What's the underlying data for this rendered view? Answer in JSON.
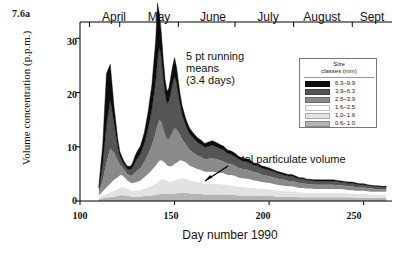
{
  "figure_label": "7.6a",
  "axes": {
    "ylabel": "Volume concentration (p.p.m.)",
    "xlabel": "Day number 1990",
    "yticks": [
      "0",
      "10",
      "20",
      "30"
    ],
    "xticks": [
      "100",
      "150",
      "200",
      "250"
    ]
  },
  "months": [
    {
      "label": "April",
      "center_day": 105
    },
    {
      "label": "May",
      "center_day": 135
    },
    {
      "label": "June",
      "center_day": 166
    },
    {
      "label": "July",
      "center_day": 196
    },
    {
      "label": "August",
      "center_day": 227
    },
    {
      "label": "Sept",
      "center_day": 255
    }
  ],
  "annotations": {
    "running_means": "5 pt running\nmeans\n(3.4 days)",
    "total_volume": "Total particulate volume"
  },
  "legend": {
    "title": "Size\nclasses (mm)",
    "title_line1": "Size",
    "title_line2": "classes (mm)",
    "entries": [
      {
        "label": "6.3–9.9",
        "color": "#0d0d0d"
      },
      {
        "label": "3.9–6.3",
        "color": "#555555"
      },
      {
        "label": "2.5–3.9",
        "color": "#8a8a8a"
      },
      {
        "label": "1.6–2.5",
        "color": "#ffffff"
      },
      {
        "label": "1.0–1.6",
        "color": "#e2e2e2"
      },
      {
        "label": "0.6–1.0",
        "color": "#b5b5b5"
      }
    ]
  },
  "chart_data": {
    "type": "area",
    "stacked": true,
    "title": "",
    "xlabel": "Day number 1990",
    "ylabel": "Volume concentration (p.p.m.)",
    "xlim": [
      100,
      265
    ],
    "ylim": [
      0,
      33
    ],
    "grid": false,
    "legend_position": "top-right",
    "x": [
      110,
      112,
      114,
      116,
      118,
      120,
      121,
      122,
      123,
      124,
      125,
      126,
      127,
      128,
      129,
      130,
      132,
      134,
      136,
      138,
      140,
      141,
      142,
      143,
      144,
      145,
      146,
      147,
      148,
      149,
      150,
      151,
      152,
      153,
      154,
      155,
      156,
      157,
      158,
      160,
      162,
      164,
      166,
      168,
      170,
      172,
      174,
      176,
      178,
      180,
      182,
      184,
      186,
      188,
      190,
      192,
      194,
      196,
      198,
      200,
      202,
      204,
      206,
      208,
      210,
      212,
      214,
      216,
      218,
      220,
      222,
      224,
      226,
      228,
      230,
      232,
      234,
      236,
      238,
      240,
      242,
      244,
      246,
      248,
      250,
      252,
      254,
      256,
      258,
      260,
      262
    ],
    "series": [
      {
        "name": "0.6-1.0",
        "color": "#b5b5b5",
        "values": [
          0.3,
          0.5,
          0.6,
          0.7,
          0.8,
          0.9,
          1.0,
          1.1,
          1.0,
          1.0,
          0.9,
          0.9,
          0.8,
          0.8,
          0.8,
          0.8,
          0.8,
          0.9,
          0.9,
          1.0,
          1.1,
          1.2,
          1.3,
          1.4,
          1.4,
          1.4,
          1.3,
          1.3,
          1.3,
          1.3,
          1.4,
          1.4,
          1.5,
          1.5,
          1.5,
          1.5,
          1.5,
          1.5,
          1.4,
          1.4,
          1.3,
          1.3,
          1.2,
          1.2,
          1.2,
          1.2,
          1.2,
          1.2,
          1.1,
          1.1,
          1.1,
          1.0,
          1.0,
          1.0,
          1.0,
          1.0,
          0.9,
          0.9,
          0.9,
          0.9,
          0.9,
          0.8,
          0.8,
          0.8,
          0.8,
          0.8,
          0.8,
          0.7,
          0.7,
          0.7,
          0.7,
          0.7,
          0.7,
          0.7,
          0.7,
          0.7,
          0.7,
          0.7,
          0.7,
          0.7,
          0.7,
          0.7,
          0.6,
          0.6,
          0.6,
          0.6,
          0.6,
          0.6,
          0.6,
          0.6,
          0.6
        ]
      },
      {
        "name": "1.0-1.6",
        "color": "#e2e2e2",
        "values": [
          0.3,
          0.5,
          0.7,
          0.9,
          1.1,
          1.3,
          1.4,
          1.5,
          1.5,
          1.4,
          1.3,
          1.2,
          1.1,
          1.1,
          1.1,
          1.1,
          1.2,
          1.4,
          1.6,
          1.8,
          2.1,
          2.3,
          2.5,
          2.6,
          2.6,
          2.5,
          2.4,
          2.3,
          2.3,
          2.3,
          2.4,
          2.5,
          2.6,
          2.7,
          2.7,
          2.7,
          2.6,
          2.5,
          2.4,
          2.3,
          2.2,
          2.1,
          2.0,
          2.0,
          2.0,
          2.0,
          1.9,
          1.9,
          1.8,
          1.8,
          1.7,
          1.6,
          1.6,
          1.5,
          1.5,
          1.4,
          1.4,
          1.3,
          1.3,
          1.2,
          1.2,
          1.1,
          1.1,
          1.0,
          1.0,
          1.0,
          0.9,
          0.9,
          0.9,
          0.8,
          0.8,
          0.8,
          0.8,
          0.8,
          0.8,
          0.8,
          0.8,
          0.8,
          0.8,
          0.8,
          0.7,
          0.7,
          0.7,
          0.7,
          0.7,
          0.7,
          0.6,
          0.6,
          0.6,
          0.6,
          0.6
        ]
      },
      {
        "name": "1.6-2.5",
        "color": "#ffffff",
        "values": [
          0.4,
          0.8,
          1.2,
          1.6,
          2.0,
          2.2,
          2.3,
          2.2,
          2.0,
          1.8,
          1.6,
          1.5,
          1.4,
          1.4,
          1.5,
          1.6,
          1.8,
          2.1,
          2.5,
          2.9,
          3.3,
          3.5,
          3.6,
          3.5,
          3.3,
          3.1,
          2.9,
          2.8,
          2.8,
          2.9,
          3.0,
          3.1,
          3.2,
          3.3,
          3.2,
          3.1,
          3.0,
          2.8,
          2.7,
          2.5,
          2.4,
          2.3,
          2.2,
          2.2,
          2.2,
          2.1,
          2.1,
          2.0,
          1.9,
          1.9,
          1.8,
          1.7,
          1.6,
          1.6,
          1.5,
          1.4,
          1.4,
          1.3,
          1.2,
          1.2,
          1.1,
          1.1,
          1.0,
          1.0,
          0.9,
          0.9,
          0.9,
          0.8,
          0.8,
          0.8,
          0.8,
          0.7,
          0.7,
          0.7,
          0.7,
          0.7,
          0.7,
          0.7,
          0.7,
          0.6,
          0.6,
          0.6,
          0.6,
          0.6,
          0.6,
          0.5,
          0.5,
          0.5,
          0.5,
          0.5,
          0.5
        ]
      },
      {
        "name": "2.5-3.9",
        "color": "#8a8a8a",
        "values": [
          0.6,
          2.0,
          4.5,
          6.5,
          5.0,
          3.0,
          2.0,
          1.6,
          1.4,
          1.3,
          1.2,
          1.2,
          1.3,
          1.5,
          1.8,
          2.0,
          2.3,
          2.8,
          3.6,
          4.6,
          6.0,
          7.0,
          7.6,
          7.0,
          6.0,
          5.2,
          4.8,
          5.0,
          5.6,
          6.2,
          6.6,
          6.2,
          5.4,
          4.6,
          4.0,
          3.6,
          3.3,
          3.1,
          2.9,
          2.7,
          2.5,
          2.4,
          2.3,
          2.4,
          2.5,
          2.4,
          2.3,
          2.2,
          2.1,
          2.0,
          1.9,
          1.8,
          1.7,
          1.7,
          1.6,
          1.5,
          1.5,
          1.4,
          1.3,
          1.3,
          1.2,
          1.2,
          1.1,
          1.1,
          1.0,
          1.0,
          0.9,
          0.9,
          0.9,
          0.8,
          0.8,
          0.8,
          0.8,
          0.8,
          0.8,
          0.8,
          0.8,
          0.7,
          0.7,
          0.7,
          0.7,
          0.7,
          0.6,
          0.6,
          0.6,
          0.6,
          0.6,
          0.5,
          0.5,
          0.5,
          0.5
        ]
      },
      {
        "name": "3.9-6.3",
        "color": "#555555",
        "values": [
          0.8,
          3.0,
          7.0,
          9.0,
          5.5,
          2.6,
          1.6,
          1.2,
          1.0,
          0.9,
          0.9,
          1.0,
          1.2,
          1.5,
          1.9,
          2.2,
          2.6,
          3.4,
          4.8,
          6.6,
          9.5,
          12.0,
          13.5,
          12.0,
          9.5,
          7.6,
          6.6,
          7.0,
          8.0,
          9.0,
          9.6,
          8.6,
          7.0,
          5.6,
          4.6,
          4.0,
          3.5,
          3.2,
          3.0,
          2.7,
          2.5,
          2.3,
          2.2,
          2.3,
          2.4,
          2.3,
          2.2,
          2.1,
          1.9,
          1.8,
          1.7,
          1.6,
          1.5,
          1.5,
          1.4,
          1.3,
          1.3,
          1.2,
          1.2,
          1.1,
          1.1,
          1.0,
          1.0,
          0.9,
          0.9,
          0.9,
          0.8,
          0.8,
          0.8,
          0.7,
          0.7,
          0.7,
          0.7,
          0.7,
          0.7,
          0.7,
          0.7,
          0.7,
          0.6,
          0.6,
          0.6,
          0.6,
          0.6,
          0.5,
          0.5,
          0.5,
          0.5,
          0.5,
          0.5,
          0.4,
          0.4
        ]
      },
      {
        "name": "6.3-9.9",
        "color": "#0d0d0d",
        "values": [
          0.6,
          3.5,
          9.5,
          6.5,
          3.0,
          1.4,
          0.9,
          0.7,
          0.6,
          0.5,
          0.5,
          0.6,
          0.7,
          0.9,
          1.1,
          1.3,
          1.5,
          2.0,
          3.0,
          4.5,
          7.5,
          10.5,
          6.0,
          4.5,
          3.5,
          2.6,
          2.2,
          2.4,
          2.8,
          3.2,
          3.4,
          3.0,
          2.4,
          1.9,
          1.6,
          1.4,
          1.2,
          1.1,
          1.0,
          0.9,
          0.8,
          0.8,
          0.7,
          0.8,
          0.8,
          0.8,
          0.7,
          0.7,
          0.6,
          0.6,
          0.6,
          0.5,
          0.5,
          0.5,
          0.5,
          0.4,
          0.4,
          0.4,
          0.4,
          0.4,
          0.3,
          0.3,
          0.3,
          0.3,
          0.3,
          0.3,
          0.3,
          0.2,
          0.2,
          0.2,
          0.2,
          0.2,
          0.2,
          0.2,
          0.2,
          0.2,
          0.2,
          0.2,
          0.2,
          0.2,
          0.2,
          0.2,
          0.2,
          0.2,
          0.2,
          0.1,
          0.1,
          0.1,
          0.1,
          0.1,
          0.1
        ]
      }
    ]
  }
}
